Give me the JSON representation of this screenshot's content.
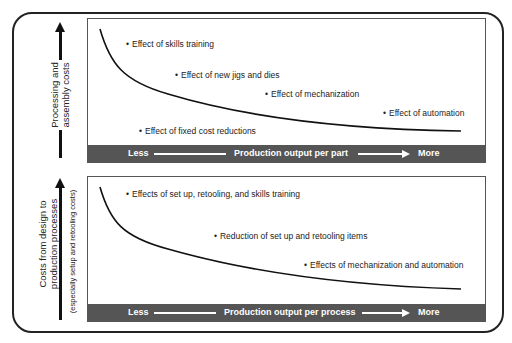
{
  "upper": {
    "y_label_line1": "Processing and",
    "y_label_line2": "assembly costs",
    "annotations": [
      "Effect of skills training",
      "Effect of new jigs and dies",
      "Effect of mechanization",
      "Effect of automation",
      "Effect of fixed cost reductions"
    ],
    "axis_less": "Less",
    "axis_label": "Production output per part",
    "axis_more": "More"
  },
  "lower": {
    "y_label_line1": "Costs from design to",
    "y_label_line2": "production processes",
    "y_label_note": "(especially setup and retooling costs)",
    "annotations": [
      "Effects of set up, retooling, and skills training",
      "Reduction of set up and retooling items",
      "Effects of mechanization and automation"
    ],
    "axis_less": "Less",
    "axis_label": "Production output per process",
    "axis_more": "More"
  }
}
